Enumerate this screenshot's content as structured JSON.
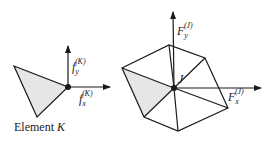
{
  "left_element": {
    "caption_prefix": "Element",
    "caption_symbol": "K",
    "force_y": {
      "base": "f",
      "sub": "y",
      "sup": "(K)"
    },
    "force_x": {
      "base": "f",
      "sub": "x",
      "sup": "(K)"
    }
  },
  "right_assembly": {
    "node_label": "J",
    "force_y": {
      "base": "F",
      "sub": "y",
      "sup": "(J)"
    },
    "force_x": {
      "base": "F",
      "sub": "x",
      "sup": "(J)"
    }
  },
  "colors": {
    "line": "#1a1a1a",
    "fill": "#e6e6e6"
  }
}
